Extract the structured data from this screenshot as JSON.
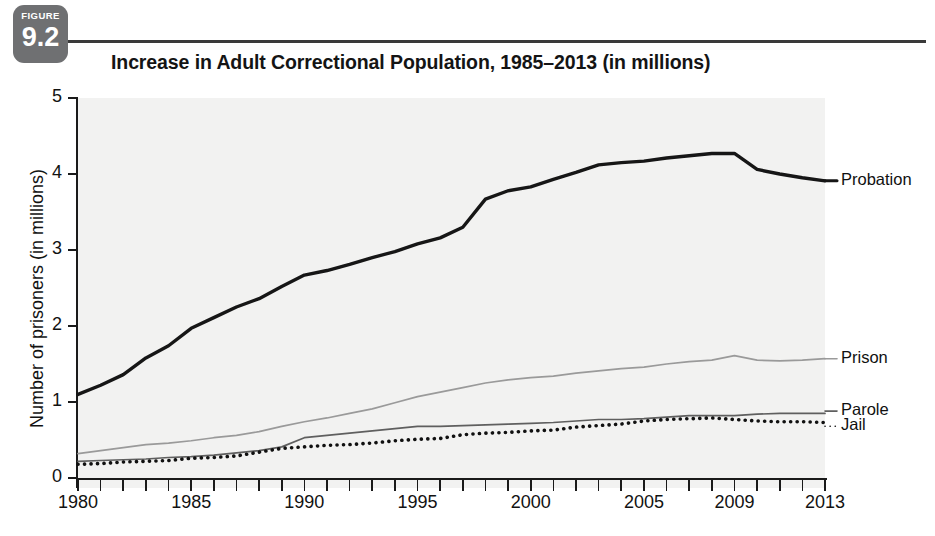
{
  "figure": {
    "badge_word": "FIGURE",
    "badge_number": "9.2",
    "title": "Increase in Adult Correctional Population, 1985–2013 (in millions)",
    "source_note": ""
  },
  "colors": {
    "badge_bg": "#6f7072",
    "plot_bg": "#f2f2f1",
    "axis": "#1a1a1a",
    "probation": "#161616",
    "prison": "#9a9a9a",
    "parole": "#5f5f5f",
    "jail": "#111111"
  },
  "chart_data": {
    "type": "line",
    "title": "Increase in Adult Correctional Population, 1985–2013 (in millions)",
    "xlabel": "",
    "ylabel": "Number of prisoners (in millions)",
    "xlim": [
      1980,
      2013
    ],
    "ylim": [
      0,
      5
    ],
    "yticks": [
      0,
      1,
      2,
      3,
      4,
      5
    ],
    "ytick_labels": [
      "0",
      "1",
      "2",
      "3",
      "4",
      "5"
    ],
    "xtick_labels": [
      "1980",
      "1985",
      "1990",
      "1995",
      "2000",
      "2005",
      "2009",
      "2013"
    ],
    "xtick_values": [
      1980,
      1985,
      1990,
      1995,
      2000,
      2005,
      2009,
      2013
    ],
    "minor_xticks_every": 1,
    "grid": false,
    "legend_position": "right-of-plot-inline",
    "x": [
      1980,
      1981,
      1982,
      1983,
      1984,
      1985,
      1986,
      1987,
      1988,
      1989,
      1990,
      1991,
      1992,
      1993,
      1994,
      1995,
      1996,
      1997,
      1998,
      1999,
      2000,
      2001,
      2002,
      2003,
      2004,
      2005,
      2006,
      2007,
      2008,
      2009,
      2010,
      2011,
      2012,
      2013
    ],
    "series": [
      {
        "name": "Probation",
        "style": "solid-thick",
        "color": "#161616",
        "values": [
          1.1,
          1.22,
          1.36,
          1.58,
          1.74,
          1.97,
          2.11,
          2.25,
          2.36,
          2.52,
          2.67,
          2.73,
          2.81,
          2.9,
          2.98,
          3.08,
          3.16,
          3.3,
          3.67,
          3.78,
          3.83,
          3.93,
          4.02,
          4.12,
          4.15,
          4.17,
          4.21,
          4.24,
          4.27,
          4.27,
          4.06,
          4.0,
          3.95,
          3.91
        ]
      },
      {
        "name": "Prison",
        "style": "solid-light",
        "color": "#9a9a9a",
        "values": [
          0.32,
          0.36,
          0.4,
          0.44,
          0.46,
          0.49,
          0.53,
          0.56,
          0.61,
          0.68,
          0.74,
          0.79,
          0.85,
          0.91,
          0.99,
          1.07,
          1.13,
          1.19,
          1.25,
          1.29,
          1.32,
          1.34,
          1.38,
          1.41,
          1.44,
          1.46,
          1.5,
          1.53,
          1.55,
          1.61,
          1.55,
          1.54,
          1.55,
          1.57
        ]
      },
      {
        "name": "Parole",
        "style": "solid-medium",
        "color": "#5f5f5f",
        "values": [
          0.22,
          0.23,
          0.24,
          0.25,
          0.27,
          0.28,
          0.3,
          0.33,
          0.36,
          0.41,
          0.53,
          0.56,
          0.59,
          0.62,
          0.65,
          0.68,
          0.68,
          0.69,
          0.7,
          0.71,
          0.72,
          0.73,
          0.75,
          0.77,
          0.77,
          0.78,
          0.8,
          0.82,
          0.82,
          0.82,
          0.84,
          0.85,
          0.85,
          0.85
        ]
      },
      {
        "name": "Jail",
        "style": "dotted",
        "color": "#111111",
        "values": [
          0.18,
          0.19,
          0.21,
          0.22,
          0.23,
          0.26,
          0.27,
          0.29,
          0.34,
          0.39,
          0.41,
          0.43,
          0.44,
          0.46,
          0.49,
          0.51,
          0.52,
          0.57,
          0.59,
          0.6,
          0.62,
          0.63,
          0.67,
          0.69,
          0.71,
          0.75,
          0.77,
          0.78,
          0.79,
          0.77,
          0.75,
          0.74,
          0.74,
          0.73
        ]
      }
    ],
    "series_end_labels": [
      {
        "name": "Probation",
        "label_y_value": 3.91
      },
      {
        "name": "Prison",
        "label_y_value": 1.57
      },
      {
        "name": "Parole",
        "label_y_value": 0.88
      },
      {
        "name": "Jail",
        "label_y_value": 0.68
      }
    ]
  }
}
